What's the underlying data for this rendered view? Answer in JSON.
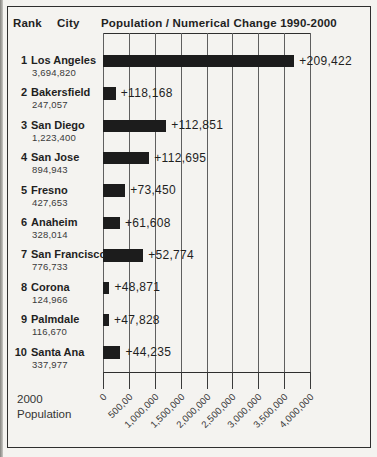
{
  "header": {
    "rank": "Rank",
    "city": "City",
    "title": "Population / Numerical Change 1990-2000"
  },
  "axis_corner_label": {
    "line1": "2000",
    "line2": "Population"
  },
  "chart_data": {
    "type": "bar",
    "orientation": "horizontal",
    "title": "Population / Numerical Change 1990-2000",
    "xlabel": "2000 Population",
    "xlim": [
      0,
      4000000
    ],
    "grid": true,
    "bar_color": "#1c1c1c",
    "x_tick_values": [
      0,
      500000,
      1000000,
      1500000,
      2000000,
      2500000,
      3000000,
      3500000,
      4000000
    ],
    "x_tick_labels": [
      "0",
      "500,00",
      "1,000,000",
      "1,500,000",
      "2,000,000",
      "2,500,000",
      "3,000,000",
      "3,500,000",
      "4,000,000"
    ],
    "rows": [
      {
        "rank": "1",
        "city": "Los Angeles",
        "population_2000_label": "3,694,820",
        "population_2000": 3694820,
        "change_label": "+209,422",
        "change": 209422
      },
      {
        "rank": "2",
        "city": "Bakersfield",
        "population_2000_label": "247,057",
        "population_2000": 247057,
        "change_label": "+118,168",
        "change": 118168
      },
      {
        "rank": "3",
        "city": "San Diego",
        "population_2000_label": "1,223,400",
        "population_2000": 1223400,
        "change_label": "+112,851",
        "change": 112851
      },
      {
        "rank": "4",
        "city": "San Jose",
        "population_2000_label": "894,943",
        "population_2000": 894943,
        "change_label": "+112,695",
        "change": 112695
      },
      {
        "rank": "5",
        "city": "Fresno",
        "population_2000_label": "427,653",
        "population_2000": 427653,
        "change_label": "+73,450",
        "change": 73450
      },
      {
        "rank": "6",
        "city": "Anaheim",
        "population_2000_label": "328,014",
        "population_2000": 328014,
        "change_label": "+61,608",
        "change": 61608
      },
      {
        "rank": "7",
        "city": "San Francisco",
        "population_2000_label": "776,733",
        "population_2000": 776733,
        "change_label": "+52,774",
        "change": 52774
      },
      {
        "rank": "8",
        "city": "Corona",
        "population_2000_label": "124,966",
        "population_2000": 124966,
        "change_label": "+48,871",
        "change": 48871
      },
      {
        "rank": "9",
        "city": "Palmdale",
        "population_2000_label": "116,670",
        "population_2000": 116670,
        "change_label": "+47,828",
        "change": 47828
      },
      {
        "rank": "10",
        "city": "Santa Ana",
        "population_2000_label": "337,977",
        "population_2000": 337977,
        "change_label": "+44,235",
        "change": 44235
      }
    ]
  }
}
